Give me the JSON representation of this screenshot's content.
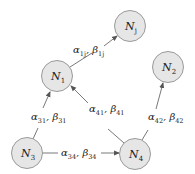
{
  "diagram": {
    "type": "directed-graph",
    "nodes": [
      {
        "id": "Nj",
        "label": "N",
        "sub": "j",
        "cx": 130,
        "cy": 26
      },
      {
        "id": "N1",
        "label": "N",
        "sub": "1",
        "cx": 57,
        "cy": 76
      },
      {
        "id": "N2",
        "label": "N",
        "sub": "2",
        "cx": 168,
        "cy": 67
      },
      {
        "id": "N3",
        "label": "N",
        "sub": "3",
        "cx": 27,
        "cy": 153
      },
      {
        "id": "N4",
        "label": "N",
        "sub": "4",
        "cx": 135,
        "cy": 154
      }
    ],
    "edges": [
      {
        "from": "N1",
        "to": "Nj",
        "alpha": "α",
        "alpha_sub": "1j",
        "beta": "β",
        "beta_sub": "1j"
      },
      {
        "from": "N3",
        "to": "N1",
        "alpha": "α",
        "alpha_sub": "31",
        "beta": "β",
        "beta_sub": "31"
      },
      {
        "from": "N4",
        "to": "N1",
        "alpha": "α",
        "alpha_sub": "41",
        "beta": "β",
        "beta_sub": "41"
      },
      {
        "from": "N4",
        "to": "N2",
        "alpha": "α",
        "alpha_sub": "42",
        "beta": "β",
        "beta_sub": "42"
      },
      {
        "from": "N3",
        "to": "N4",
        "alpha": "α",
        "alpha_sub": "34",
        "beta": "β",
        "beta_sub": "34"
      }
    ],
    "colors": {
      "node_fill": "#e6e6e6",
      "node_stroke": "#9a9a9a",
      "edge": "#555555",
      "text": "#222222"
    }
  }
}
